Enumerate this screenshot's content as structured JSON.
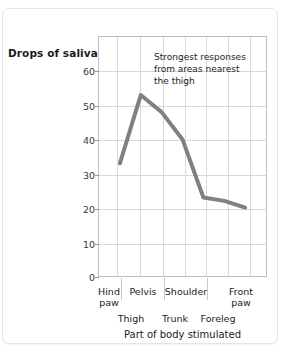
{
  "chart_data": {
    "type": "line",
    "title": "",
    "xlabel": "Part of body stimulated",
    "ylabel": "Drops of saliva",
    "categories": [
      "Hind paw",
      "Thigh",
      "Pelvis",
      "Trunk",
      "Shoulder",
      "Foreleg",
      "Front paw"
    ],
    "values": [
      33,
      53,
      48,
      40,
      23,
      22,
      20
    ],
    "series": [
      {
        "name": "Drops of saliva",
        "values": [
          33,
          53,
          48,
          40,
          23,
          22,
          20
        ],
        "color": "#808080"
      }
    ],
    "ylim": [
      0,
      70
    ],
    "yticks": [
      0,
      10,
      20,
      30,
      40,
      50,
      60
    ],
    "ytick_labels": [
      "0",
      "10",
      "20",
      "30",
      "40",
      "50",
      "60"
    ],
    "grid": true,
    "legend": "none",
    "annotations": [
      {
        "lines": [
          "Strongest responses",
          "from areas nearest",
          "the thigh"
        ],
        "near": "Thigh"
      }
    ]
  },
  "axis": {
    "y_label": "Drops of saliva",
    "x_title": "Part of body stimulated",
    "y_ticks": [
      "60",
      "50",
      "40",
      "30",
      "20",
      "10",
      "0"
    ],
    "x_labels_row1": [
      "Hind\npaw",
      "Pelvis",
      "Shoulder",
      "Front\npaw"
    ],
    "x_labels_row1_line1": [
      "Hind",
      "Pelvis",
      "Shoulder",
      "Front"
    ],
    "x_labels_row1_line2": [
      "paw",
      "",
      "",
      "paw"
    ],
    "x_labels_row2": [
      "Thigh",
      "Trunk",
      "Foreleg"
    ]
  },
  "annotation": {
    "line1": "Strongest responses",
    "line2": "from areas nearest",
    "line3": "the thigh"
  },
  "colors": {
    "line": "#808080",
    "grid": "#d9d9d9",
    "frame": "#bfbfbf",
    "text": "#1b1b1b",
    "card_border": "#e6e6e8"
  }
}
